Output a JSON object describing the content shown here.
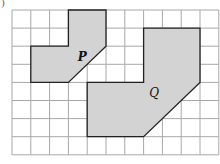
{
  "part_marker": ")",
  "grid": {
    "cols": 11,
    "rows": 8,
    "origin_x": 12,
    "origin_y": 10,
    "cell_w": 18.8,
    "cell_h": 18.1,
    "line_color": "#a8a8a8"
  },
  "shapes": [
    {
      "name": "P",
      "label": "P",
      "label_pos": [
        3.5,
        2.8
      ],
      "bold": true,
      "vertices": [
        [
          3,
          0
        ],
        [
          5,
          0
        ],
        [
          5,
          2
        ],
        [
          3,
          4
        ],
        [
          1,
          4
        ],
        [
          1,
          2
        ],
        [
          3,
          2
        ]
      ],
      "fill": "#d3d3d3"
    },
    {
      "name": "Q",
      "label": "Q",
      "label_pos": [
        7.3,
        4.8
      ],
      "bold": false,
      "vertices": [
        [
          7,
          1
        ],
        [
          10,
          1
        ],
        [
          10,
          4
        ],
        [
          7,
          7
        ],
        [
          4,
          7
        ],
        [
          4,
          4
        ],
        [
          7,
          4
        ]
      ],
      "fill": "#d3d3d3"
    }
  ]
}
